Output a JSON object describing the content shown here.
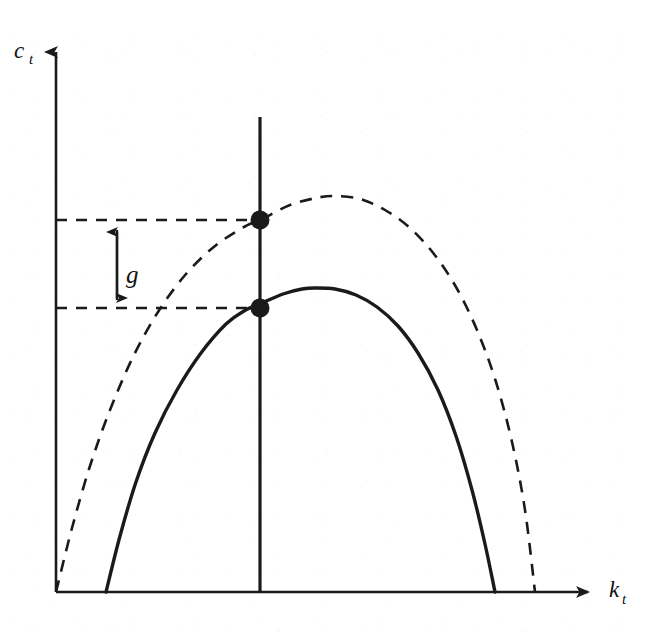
{
  "figure": {
    "background_color": "#ffffff",
    "ink_color": "#1a1a1a"
  },
  "axes": {
    "y_label": "c",
    "y_label_sub": "t",
    "x_label": "k",
    "x_label_sub": "t",
    "origin": {
      "x": 56,
      "y": 592
    },
    "y_axis_top": {
      "x": 56,
      "y": 40
    },
    "x_axis_right": {
      "x": 600,
      "y": 592
    },
    "arrowheads": true,
    "grid": false
  },
  "annotations": {
    "gap_label": "g",
    "gap_label_position": {
      "x": 130,
      "y": 272
    },
    "gap_arrow_x": 117,
    "gap_arrow_top_y": 220,
    "gap_arrow_bottom_y": 308
  },
  "vertical_line": {
    "name": "steady-state-capital-line",
    "x": 260,
    "y_top": 117,
    "y_bottom": 592,
    "style": "solid",
    "width": 3.2
  },
  "dashed_guides": [
    {
      "name": "upper-consumption-level",
      "y": 220,
      "x_start": 56,
      "x_end": 262
    },
    {
      "name": "lower-consumption-level",
      "y": 308,
      "x_start": 56,
      "x_end": 262
    }
  ],
  "markers": [
    {
      "name": "upper-steady-state-point",
      "x": 260,
      "y": 220,
      "radius": 9.5
    },
    {
      "name": "lower-steady-state-point",
      "x": 260,
      "y": 308,
      "radius": 9.5
    }
  ],
  "chart_data": {
    "type": "line",
    "title": "",
    "xlabel": "k_t",
    "ylabel": "c_t",
    "xlim": [
      0,
      600
    ],
    "ylim": [
      0,
      592
    ],
    "grid": false,
    "legend": null,
    "annotations": [
      {
        "text": "g",
        "type": "gap-measure",
        "between": [
          "upper-consumption-level",
          "lower-consumption-level"
        ]
      }
    ],
    "series": [
      {
        "name": "shifted-consumption-locus",
        "style": "dashed",
        "color": "#1a1a1a",
        "width": 2.6,
        "x_intercept_left": 56,
        "x_intercept_right": 535,
        "peak": {
          "x": 335,
          "y": 196
        },
        "points": [
          [
            56,
            592
          ],
          [
            72,
            528
          ],
          [
            90,
            466
          ],
          [
            110,
            410
          ],
          [
            133,
            357
          ],
          [
            158,
            312
          ],
          [
            186,
            274
          ],
          [
            215,
            246
          ],
          [
            244,
            227
          ],
          [
            262,
            219
          ],
          [
            290,
            205
          ],
          [
            316,
            198
          ],
          [
            335,
            196
          ],
          [
            360,
            199
          ],
          [
            385,
            210
          ],
          [
            410,
            228
          ],
          [
            434,
            254
          ],
          [
            456,
            287
          ],
          [
            477,
            330
          ],
          [
            496,
            382
          ],
          [
            512,
            442
          ],
          [
            525,
            510
          ],
          [
            535,
            592
          ]
        ]
      },
      {
        "name": "original-consumption-locus",
        "style": "solid",
        "color": "#1a1a1a",
        "width": 3.4,
        "x_intercept_left": 106,
        "x_intercept_right": 495,
        "peak": {
          "x": 315,
          "y": 288
        },
        "points": [
          [
            106,
            592
          ],
          [
            120,
            536
          ],
          [
            136,
            482
          ],
          [
            155,
            433
          ],
          [
            177,
            390
          ],
          [
            201,
            353
          ],
          [
            226,
            324
          ],
          [
            244,
            311
          ],
          [
            262,
            303
          ],
          [
            283,
            294
          ],
          [
            302,
            289
          ],
          [
            315,
            288
          ],
          [
            335,
            289
          ],
          [
            356,
            295
          ],
          [
            377,
            307
          ],
          [
            398,
            326
          ],
          [
            418,
            353
          ],
          [
            438,
            390
          ],
          [
            456,
            436
          ],
          [
            472,
            490
          ],
          [
            485,
            544
          ],
          [
            495,
            592
          ]
        ]
      }
    ]
  }
}
